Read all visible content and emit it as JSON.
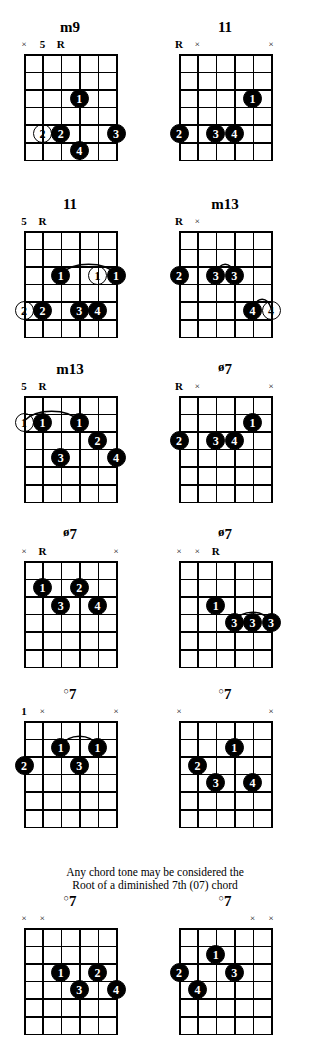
{
  "page": {
    "caption": {
      "line1": "Any chord tone may be considered the",
      "line2": "Root of a diminished 7th (07) chord"
    },
    "grid": {
      "strings": 6,
      "frets": 6,
      "string_labels": [
        "1",
        "2",
        "3",
        "4",
        "5",
        "6"
      ]
    }
  },
  "diagrams": [
    {
      "id": "m9-1",
      "name": "m9",
      "symbol": "none",
      "row": 0,
      "col": 0,
      "markers": [
        {
          "string": 1,
          "text": "×",
          "kind": "x"
        },
        {
          "string": 2,
          "text": "5",
          "kind": "num"
        },
        {
          "string": 3,
          "text": "R",
          "kind": "r"
        }
      ],
      "dots": [
        {
          "string": 4,
          "fret": 3,
          "finger": "1",
          "open": false
        },
        {
          "string": 2,
          "fret": 5,
          "finger": "2",
          "open": true
        },
        {
          "string": 3,
          "fret": 5,
          "finger": "2",
          "open": false
        },
        {
          "string": 6,
          "fret": 5,
          "finger": "3",
          "open": false
        },
        {
          "string": 4,
          "fret": 6,
          "finger": "4",
          "open": false
        }
      ],
      "barres": []
    },
    {
      "id": "11-1",
      "name": "11",
      "symbol": "none",
      "row": 0,
      "col": 1,
      "markers": [
        {
          "string": 1,
          "text": "R",
          "kind": "r"
        },
        {
          "string": 2,
          "text": "×",
          "kind": "x"
        },
        {
          "string": 6,
          "text": "×",
          "kind": "x"
        }
      ],
      "dots": [
        {
          "string": 5,
          "fret": 3,
          "finger": "1",
          "open": false
        },
        {
          "string": 1,
          "fret": 5,
          "finger": "2",
          "open": false
        },
        {
          "string": 3,
          "fret": 5,
          "finger": "3",
          "open": false
        },
        {
          "string": 4,
          "fret": 5,
          "finger": "4",
          "open": false
        }
      ],
      "barres": []
    },
    {
      "id": "11-2",
      "name": "11",
      "symbol": "none",
      "row": 1,
      "col": 0,
      "markers": [
        {
          "string": 1,
          "text": "5",
          "kind": "num"
        },
        {
          "string": 2,
          "text": "R",
          "kind": "r"
        }
      ],
      "dots": [
        {
          "string": 3,
          "fret": 3,
          "finger": "1",
          "open": false
        },
        {
          "string": 5,
          "fret": 3,
          "finger": "1",
          "open": true
        },
        {
          "string": 6,
          "fret": 3,
          "finger": "1",
          "open": false
        },
        {
          "string": 1,
          "fret": 5,
          "finger": "2",
          "open": true
        },
        {
          "string": 2,
          "fret": 5,
          "finger": "2",
          "open": false
        },
        {
          "string": 4,
          "fret": 5,
          "finger": "3",
          "open": false
        },
        {
          "string": 5,
          "fret": 5,
          "finger": "4",
          "open": false
        }
      ],
      "barres": [
        {
          "fret": 3,
          "from": 3,
          "to": 6
        }
      ]
    },
    {
      "id": "m13-1",
      "name": "m13",
      "symbol": "none",
      "row": 1,
      "col": 1,
      "markers": [
        {
          "string": 1,
          "text": "R",
          "kind": "r"
        },
        {
          "string": 2,
          "text": "×",
          "kind": "x"
        }
      ],
      "dots": [
        {
          "string": 1,
          "fret": 3,
          "finger": "2",
          "open": false
        },
        {
          "string": 3,
          "fret": 3,
          "finger": "3",
          "open": false
        },
        {
          "string": 4,
          "fret": 3,
          "finger": "3",
          "open": false
        },
        {
          "string": 5,
          "fret": 5,
          "finger": "4",
          "open": false
        },
        {
          "string": 6,
          "fret": 5,
          "finger": "4",
          "open": true
        }
      ],
      "barres": [
        {
          "fret": 3,
          "from": 3,
          "to": 4
        },
        {
          "fret": 5,
          "from": 5,
          "to": 6
        }
      ]
    },
    {
      "id": "m13-2",
      "name": "m13",
      "symbol": "none",
      "row": 2,
      "col": 0,
      "markers": [
        {
          "string": 1,
          "text": "5",
          "kind": "num"
        },
        {
          "string": 2,
          "text": "R",
          "kind": "r"
        }
      ],
      "dots": [
        {
          "string": 1,
          "fret": 2,
          "finger": "1",
          "open": true
        },
        {
          "string": 2,
          "fret": 2,
          "finger": "1",
          "open": false
        },
        {
          "string": 4,
          "fret": 2,
          "finger": "1",
          "open": false
        },
        {
          "string": 5,
          "fret": 3,
          "finger": "2",
          "open": false
        },
        {
          "string": 3,
          "fret": 4,
          "finger": "3",
          "open": false
        },
        {
          "string": 6,
          "fret": 4,
          "finger": "4",
          "open": false
        }
      ],
      "barres": [
        {
          "fret": 2,
          "from": 1,
          "to": 4
        }
      ]
    },
    {
      "id": "halfdim7-1",
      "name": "7",
      "symbol": "halfdim",
      "row": 2,
      "col": 1,
      "markers": [
        {
          "string": 1,
          "text": "R",
          "kind": "r"
        },
        {
          "string": 2,
          "text": "×",
          "kind": "x"
        },
        {
          "string": 6,
          "text": "×",
          "kind": "x"
        }
      ],
      "dots": [
        {
          "string": 5,
          "fret": 2,
          "finger": "1",
          "open": false
        },
        {
          "string": 1,
          "fret": 3,
          "finger": "2",
          "open": false
        },
        {
          "string": 3,
          "fret": 3,
          "finger": "3",
          "open": false
        },
        {
          "string": 4,
          "fret": 3,
          "finger": "4",
          "open": false
        }
      ],
      "barres": []
    },
    {
      "id": "halfdim7-2",
      "name": "7",
      "symbol": "halfdim",
      "row": 3,
      "col": 0,
      "markers": [
        {
          "string": 1,
          "text": "×",
          "kind": "x"
        },
        {
          "string": 2,
          "text": "R",
          "kind": "r"
        },
        {
          "string": 6,
          "text": "×",
          "kind": "x"
        }
      ],
      "dots": [
        {
          "string": 2,
          "fret": 2,
          "finger": "1",
          "open": false
        },
        {
          "string": 4,
          "fret": 2,
          "finger": "2",
          "open": false
        },
        {
          "string": 3,
          "fret": 3,
          "finger": "3",
          "open": false
        },
        {
          "string": 5,
          "fret": 3,
          "finger": "4",
          "open": false
        }
      ],
      "barres": []
    },
    {
      "id": "halfdim7-3",
      "name": "7",
      "symbol": "halfdim",
      "row": 3,
      "col": 1,
      "markers": [
        {
          "string": 1,
          "text": "×",
          "kind": "x"
        },
        {
          "string": 2,
          "text": "×",
          "kind": "x"
        },
        {
          "string": 3,
          "text": "R",
          "kind": "r"
        }
      ],
      "dots": [
        {
          "string": 3,
          "fret": 3,
          "finger": "1",
          "open": false
        },
        {
          "string": 4,
          "fret": 4,
          "finger": "3",
          "open": false
        },
        {
          "string": 5,
          "fret": 4,
          "finger": "3",
          "open": false
        },
        {
          "string": 6,
          "fret": 4,
          "finger": "3",
          "open": false
        }
      ],
      "barres": [
        {
          "fret": 4,
          "from": 4,
          "to": 6
        }
      ]
    },
    {
      "id": "dim7-1",
      "name": "7",
      "symbol": "dim",
      "row": 4,
      "col": 0,
      "markers": [
        {
          "string": 1,
          "text": "1",
          "kind": "num"
        },
        {
          "string": 2,
          "text": "×",
          "kind": "x"
        },
        {
          "string": 6,
          "text": "×",
          "kind": "x"
        }
      ],
      "dots": [
        {
          "string": 3,
          "fret": 2,
          "finger": "1",
          "open": false
        },
        {
          "string": 5,
          "fret": 2,
          "finger": "1",
          "open": false
        },
        {
          "string": 1,
          "fret": 3,
          "finger": "2",
          "open": false
        },
        {
          "string": 4,
          "fret": 3,
          "finger": "3",
          "open": false
        }
      ],
      "barres": [
        {
          "fret": 2,
          "from": 3,
          "to": 5
        }
      ]
    },
    {
      "id": "dim7-2",
      "name": "7",
      "symbol": "dim",
      "row": 4,
      "col": 1,
      "markers": [
        {
          "string": 1,
          "text": "×",
          "kind": "x"
        },
        {
          "string": 6,
          "text": "×",
          "kind": "x"
        }
      ],
      "dots": [
        {
          "string": 4,
          "fret": 2,
          "finger": "1",
          "open": false
        },
        {
          "string": 2,
          "fret": 3,
          "finger": "2",
          "open": false
        },
        {
          "string": 3,
          "fret": 4,
          "finger": "3",
          "open": false
        },
        {
          "string": 5,
          "fret": 4,
          "finger": "4",
          "open": false
        }
      ],
      "barres": []
    },
    {
      "id": "dim7-3",
      "name": "7",
      "symbol": "dim",
      "row": 5,
      "col": 0,
      "markers": [
        {
          "string": 1,
          "text": "×",
          "kind": "x"
        },
        {
          "string": 2,
          "text": "×",
          "kind": "x"
        }
      ],
      "dots": [
        {
          "string": 3,
          "fret": 3,
          "finger": "1",
          "open": false
        },
        {
          "string": 5,
          "fret": 3,
          "finger": "2",
          "open": false
        },
        {
          "string": 4,
          "fret": 4,
          "finger": "3",
          "open": false
        },
        {
          "string": 6,
          "fret": 4,
          "finger": "4",
          "open": false
        }
      ],
      "barres": []
    },
    {
      "id": "dim7-4",
      "name": "7",
      "symbol": "dim",
      "row": 5,
      "col": 1,
      "markers": [
        {
          "string": 5,
          "text": "×",
          "kind": "x"
        },
        {
          "string": 6,
          "text": "×",
          "kind": "x"
        }
      ],
      "dots": [
        {
          "string": 3,
          "fret": 2,
          "finger": "1",
          "open": false
        },
        {
          "string": 1,
          "fret": 3,
          "finger": "2",
          "open": false
        },
        {
          "string": 4,
          "fret": 3,
          "finger": "3",
          "open": false
        },
        {
          "string": 2,
          "fret": 4,
          "finger": "4",
          "open": false
        }
      ],
      "barres": []
    }
  ]
}
